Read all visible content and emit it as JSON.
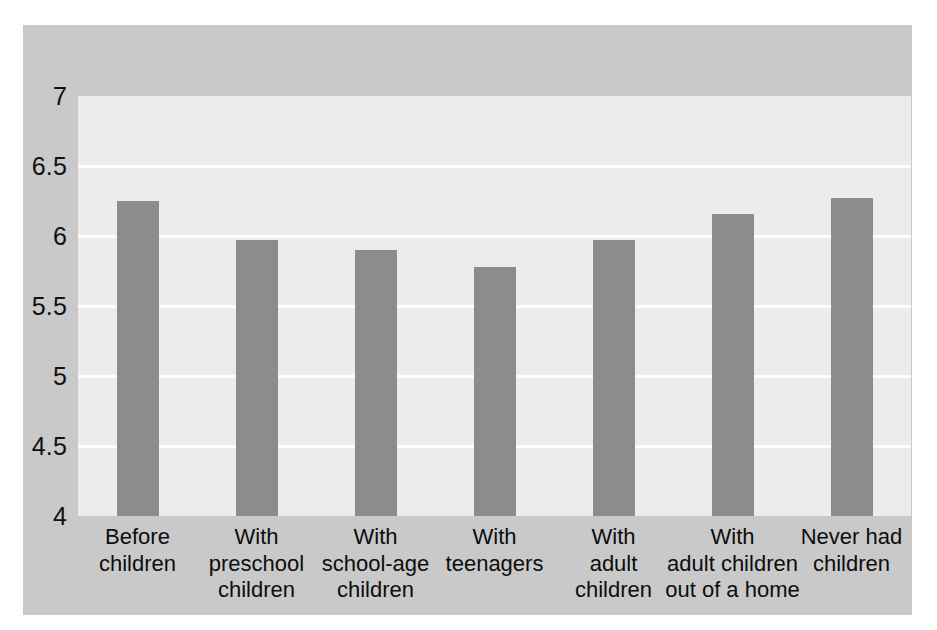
{
  "chart_data": {
    "type": "bar",
    "title": "",
    "subtitle": "",
    "xlabel": "",
    "ylabel": "",
    "categories": [
      "Before\nchildren",
      "With\npreschool\nchildren",
      "With\nschool-age\nchildren",
      "With\nteenagers",
      "With\nadult\nchildren",
      "With\nadult children\nout of a home",
      "Never had\nchildren"
    ],
    "values": [
      6.25,
      5.97,
      5.9,
      5.78,
      5.97,
      6.16,
      6.27
    ],
    "ylim": [
      4,
      7
    ],
    "yticks": [
      7,
      6.5,
      6,
      5.5,
      5,
      4.5,
      4
    ],
    "ytick_labels": [
      "7",
      "6.5",
      "6",
      "5.5",
      "5",
      "4.5",
      "4"
    ],
    "grid": true,
    "legend": "none",
    "bar_color": "#8c8c8c",
    "plot_background": "#ececec",
    "gridline_color": "#fdfdfd",
    "figure_background": "#c9c9c9"
  }
}
